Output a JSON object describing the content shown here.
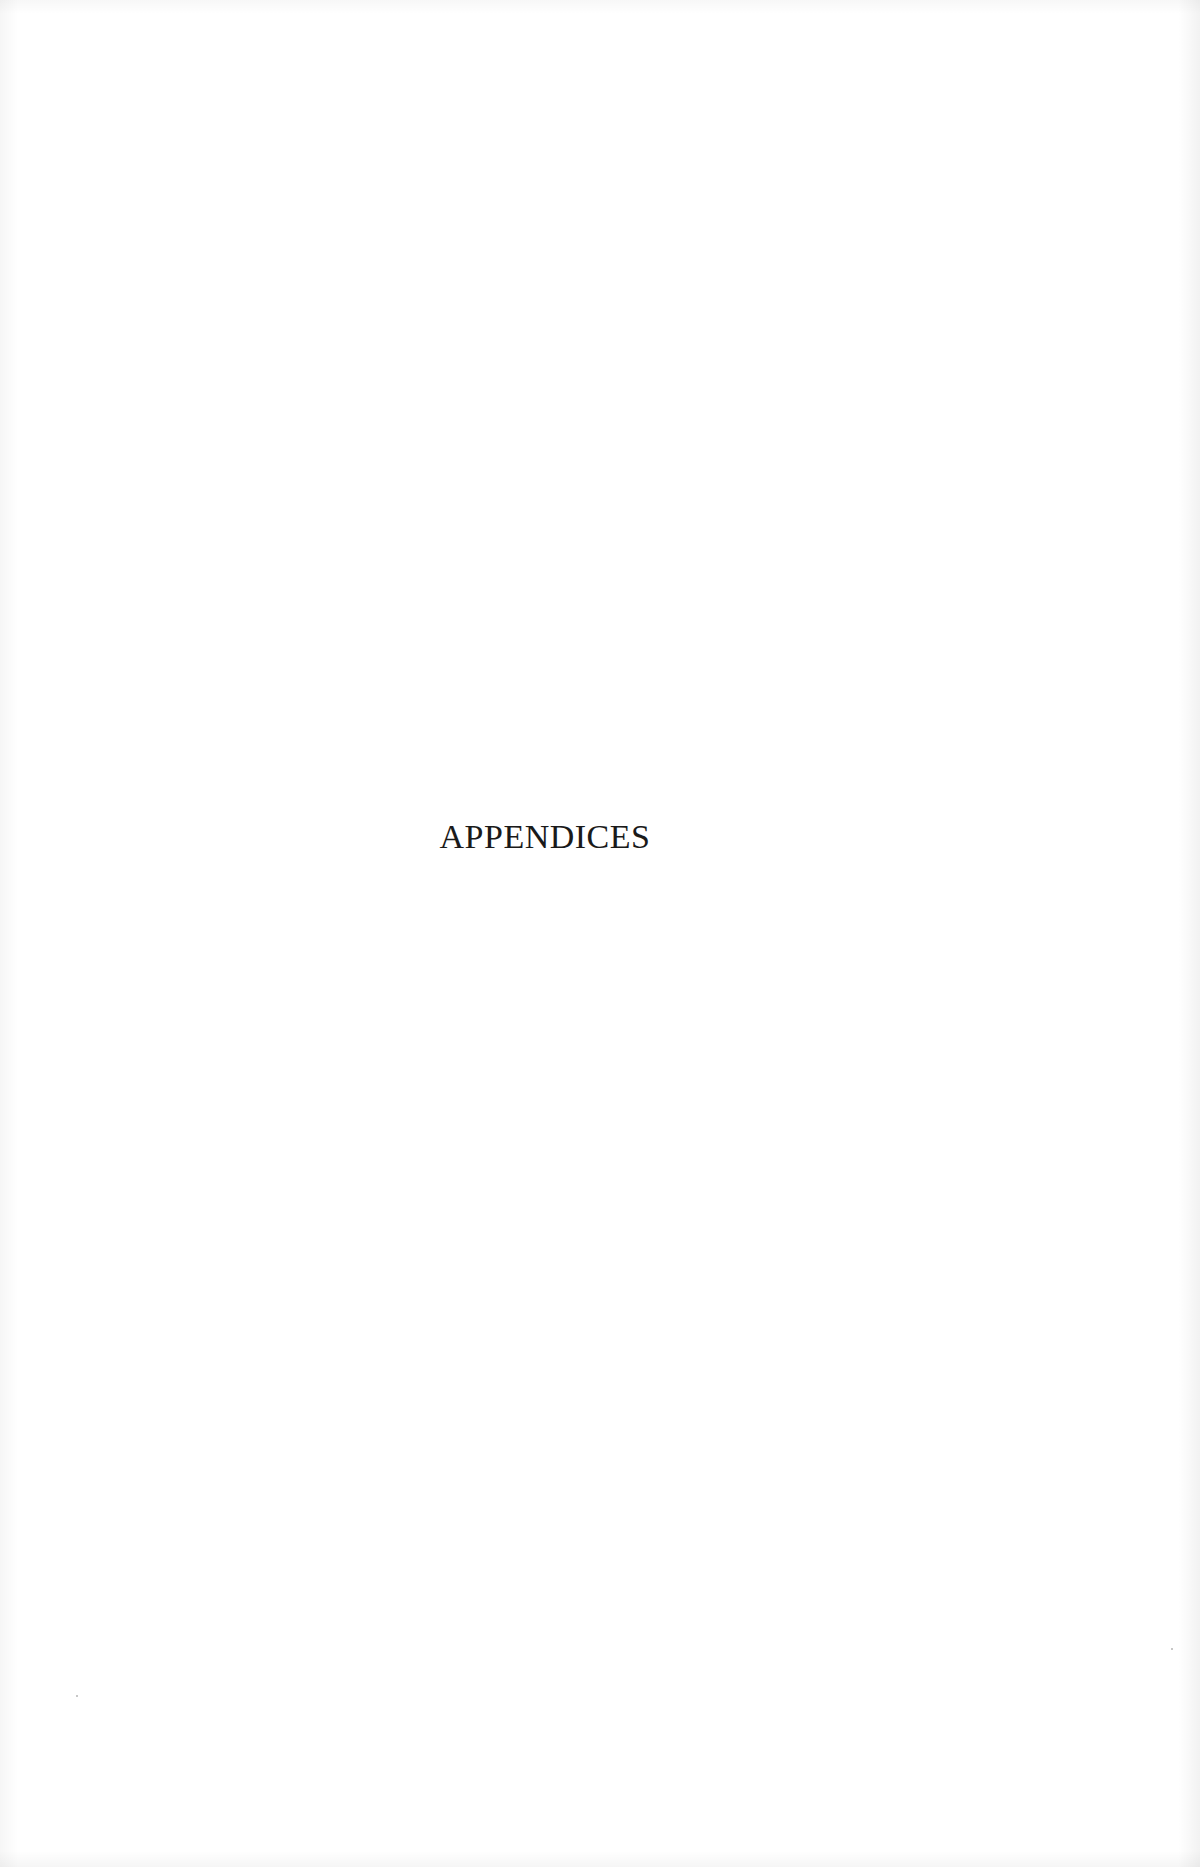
{
  "page": {
    "heading": "APPENDICES"
  },
  "colors": {
    "background": "#ffffff",
    "text": "#1a1a1a"
  }
}
